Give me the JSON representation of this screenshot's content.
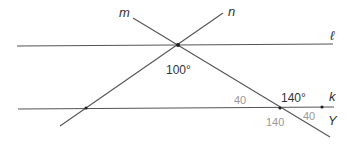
{
  "diagram": {
    "lines": [
      {
        "id": "l",
        "label": "ℓ",
        "x1": 17,
        "y1": 46,
        "x2": 333,
        "y2": 44
      },
      {
        "id": "k",
        "label": "k",
        "x1": 18,
        "y1": 109,
        "x2": 334,
        "y2": 107
      },
      {
        "id": "m",
        "label": "m",
        "x1": 133,
        "y1": 18,
        "x2": 330,
        "y2": 137
      },
      {
        "id": "n",
        "label": "n",
        "x1": 223,
        "y1": 13,
        "x2": 60,
        "y2": 126
      }
    ],
    "points": [
      {
        "name": "intersection-m-n-l",
        "x": 178,
        "y": 45
      },
      {
        "name": "intersection-n-k",
        "x": 86,
        "y": 108
      },
      {
        "name": "intersection-m-k",
        "x": 280,
        "y": 108
      },
      {
        "name": "point-Y",
        "x": 322,
        "y": 107
      }
    ],
    "labels": {
      "m": "m",
      "n": "n",
      "l": "ℓ",
      "k": "k",
      "Y": "Y"
    },
    "angles": {
      "top_angle": "100°",
      "left_of_mk_above": "40",
      "right_of_mk_above": "140°",
      "left_of_mk_below": "140",
      "right_of_mk_below": "40"
    }
  }
}
